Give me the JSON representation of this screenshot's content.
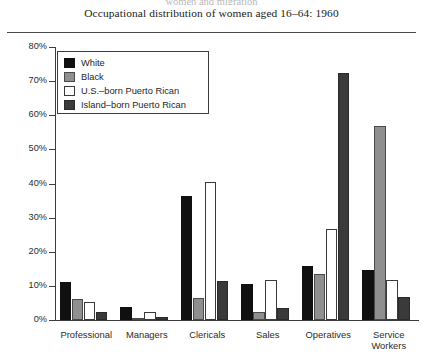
{
  "header": {
    "running_head": "women and migration",
    "title": "Occupational distribution of women aged 16–64: 1960"
  },
  "axis": {
    "y_ticks": [
      "80%",
      "70%",
      "60%",
      "50%",
      "40%",
      "30%",
      "20%",
      "10%",
      "0%"
    ],
    "y_tick_values": [
      80,
      70,
      60,
      50,
      40,
      30,
      20,
      10,
      0
    ]
  },
  "legend": {
    "items": [
      {
        "label": "White",
        "key": "white-grp",
        "color": "#101010"
      },
      {
        "label": "Black",
        "key": "black-grp",
        "color": "#8f8f8f"
      },
      {
        "label": "U.S.–born Puerto Rican",
        "key": "usborn-grp",
        "color": "#ffffff"
      },
      {
        "label": "Island–born Puerto Rican",
        "key": "islandborn-grp",
        "color": "#3a3a3a"
      }
    ]
  },
  "chart_data": {
    "type": "bar",
    "title": "Occupational distribution of women aged 16–64: 1960",
    "xlabel": "",
    "ylabel": "",
    "ylim": [
      0,
      80
    ],
    "y_unit": "%",
    "grid": false,
    "legend_position": "top-left-inside",
    "categories": [
      "Professional",
      "Managers",
      "Clericals",
      "Sales",
      "Operatives",
      "Service Workers"
    ],
    "category_labels_multiline": [
      [
        "Professional"
      ],
      [
        "Managers"
      ],
      [
        "Clericals"
      ],
      [
        "Sales"
      ],
      [
        "Operatives"
      ],
      [
        "Service",
        "Workers"
      ]
    ],
    "series": [
      {
        "name": "White",
        "color": "#101010",
        "values": [
          11.1,
          3.8,
          36.2,
          10.5,
          15.8,
          14.6
        ]
      },
      {
        "name": "Black",
        "color": "#8f8f8f",
        "values": [
          6.3,
          0.6,
          6.5,
          2.4,
          13.6,
          56.8
        ]
      },
      {
        "name": "U.S.–born Puerto Rican",
        "color": "#ffffff",
        "values": [
          5.2,
          2.2,
          40.3,
          11.7,
          26.8,
          11.8
        ]
      },
      {
        "name": "Island–born Puerto Rican",
        "color": "#3a3a3a",
        "values": [
          2.2,
          0.8,
          11.5,
          3.6,
          72.4,
          6.7
        ]
      }
    ]
  }
}
